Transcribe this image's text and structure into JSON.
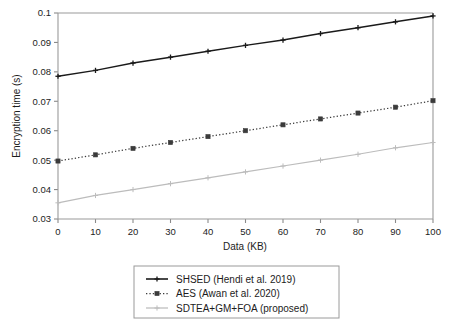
{
  "chart_data": {
    "type": "line",
    "title": "",
    "xlabel": "Data (KB)",
    "ylabel": "Encryption time (s)",
    "xlim": [
      0,
      100
    ],
    "ylim": [
      0.03,
      0.1
    ],
    "grid": false,
    "legend_position": "below-outside",
    "x": [
      0,
      10,
      20,
      30,
      40,
      50,
      60,
      70,
      80,
      90,
      100
    ],
    "xticks": [
      "0",
      "10",
      "20",
      "30",
      "40",
      "50",
      "60",
      "70",
      "80",
      "90",
      "100"
    ],
    "yticks": [
      "0.03",
      "0.04",
      "0.05",
      "0.06",
      "0.07",
      "0.08",
      "0.09",
      "0.1"
    ],
    "ytick_values": [
      0.03,
      0.04,
      0.05,
      0.06,
      0.07,
      0.08,
      0.09,
      0.1
    ],
    "series": [
      {
        "name": "SHSED (Hendi et al. 2019)",
        "color": "#1a1a1a",
        "line_style": "solid",
        "marker": "plus",
        "values": [
          0.0785,
          0.0805,
          0.083,
          0.085,
          0.087,
          0.089,
          0.0908,
          0.093,
          0.095,
          0.097,
          0.099
        ]
      },
      {
        "name": "AES (Awan et al. 2020)",
        "color": "#3b3b3b",
        "line_style": "dotted",
        "marker": "square",
        "values": [
          0.0497,
          0.0518,
          0.054,
          0.056,
          0.058,
          0.06,
          0.062,
          0.064,
          0.066,
          0.068,
          0.0702
        ]
      },
      {
        "name": "SDTEA+GM+FOA (proposed)",
        "color": "#bcbcbc",
        "line_style": "solid",
        "marker": "plus",
        "values": [
          0.0355,
          0.038,
          0.04,
          0.042,
          0.044,
          0.046,
          0.048,
          0.05,
          0.052,
          0.0542,
          0.056
        ]
      }
    ]
  },
  "legend": {
    "entries": [
      {
        "label": "SHSED (Hendi et al. 2019)"
      },
      {
        "label": "AES (Awan et al. 2020)"
      },
      {
        "label": "SDTEA+GM+FOA (proposed)"
      }
    ]
  },
  "colors": {
    "axis": "#8a8a8a",
    "frame": "#9a9a9a",
    "text": "#1c1c1c",
    "series_1": "#1a1a1a",
    "series_2": "#3b3b3b",
    "series_3": "#bcbcbc",
    "background": "#ffffff"
  }
}
